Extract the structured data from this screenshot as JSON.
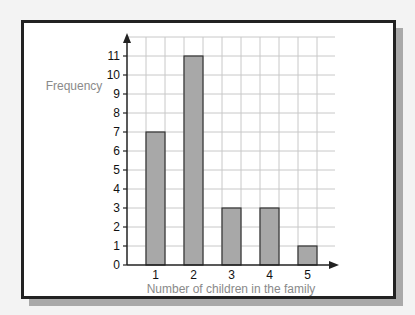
{
  "chart_data": {
    "type": "bar",
    "title": "",
    "xlabel": "Number of children in the family",
    "ylabel": "Frequency",
    "categories": [
      "1",
      "2",
      "3",
      "4",
      "5"
    ],
    "values": [
      7,
      11,
      3,
      3,
      1
    ],
    "y_ticks": [
      "0",
      "1",
      "2",
      "3",
      "4",
      "5",
      "6",
      "7",
      "8",
      "9",
      "10",
      "11"
    ],
    "ylim": [
      0,
      11.5
    ],
    "grid": true,
    "legend": null
  },
  "colors": {
    "bar_fill": "#a8a8a8",
    "bar_edge": "#333333",
    "grid": "#c8c8c8",
    "axis": "#222222",
    "axis_title": "#8a8a8a",
    "frame": "#222222",
    "shadow": "#a9a9a9"
  }
}
